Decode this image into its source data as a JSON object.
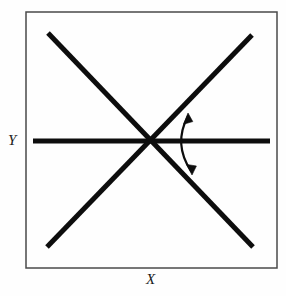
{
  "figure": {
    "background_color": "#fefefe",
    "frame": {
      "name": "plot-frame",
      "x": 26,
      "y": 12,
      "width": 251,
      "height": 256,
      "stroke_color": "#4a4a4a",
      "stroke_width": 1.5,
      "fill": "none"
    },
    "axis_labels": {
      "y_label": "Y",
      "x_label": "X",
      "color": "#1a1a1a",
      "style": "italic-serif",
      "font_size": 15
    },
    "lines": [
      {
        "name": "horizontal-axis-line",
        "kind": "horizontal",
        "x1": 33,
        "y1": 141,
        "x2": 270,
        "y2": 141,
        "stroke_color": "#0d0d0d",
        "stroke_width": 5
      },
      {
        "name": "ascending-diagonal-line",
        "kind": "diagonal-up",
        "x1": 47,
        "y1": 247,
        "x2": 252,
        "y2": 35,
        "stroke_color": "#0d0d0d",
        "stroke_width": 5
      },
      {
        "name": "descending-diagonal-line",
        "kind": "diagonal-down",
        "x1": 48,
        "y1": 33,
        "x2": 253,
        "y2": 247,
        "stroke_color": "#0d0d0d",
        "stroke_width": 5
      }
    ],
    "intersection_point": {
      "name": "lines-intersection",
      "x": 152,
      "y": 142
    },
    "angle_arrow": {
      "name": "angle-double-arrow",
      "description": "double-headed curved arrow spanning the angle between the horizontal line and the ascending diagonal",
      "arc_start_x": 188,
      "arc_start_y": 116,
      "arc_control_x": 173,
      "arc_control_y": 144,
      "arc_end_x": 191,
      "arc_end_y": 171,
      "stroke_color": "#0d0d0d",
      "stroke_width": 2.2,
      "head_count": 2,
      "head_top_direction": "up-right",
      "head_bottom_direction": "down-left"
    }
  }
}
